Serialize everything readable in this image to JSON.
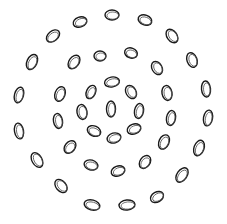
{
  "figure": {
    "stroke_color": "#1a1a1a",
    "background": "#ffffff",
    "rings": [
      {
        "name": "center",
        "loops": [
          {
            "cx": 111,
            "cy": 109,
            "rx": 4.5,
            "ry": 8,
            "rot": 0
          }
        ]
      },
      {
        "name": "ring-1",
        "loops": [
          {
            "cx": 91,
            "cy": 92,
            "rx": 4.5,
            "ry": 7,
            "rot": 25
          },
          {
            "cx": 112,
            "cy": 82,
            "rx": 7.5,
            "ry": 5,
            "rot": -10
          },
          {
            "cx": 131,
            "cy": 92,
            "rx": 5,
            "ry": 7,
            "rot": -30
          },
          {
            "cx": 139,
            "cy": 111,
            "rx": 4.5,
            "ry": 7.5,
            "rot": 10
          },
          {
            "cx": 134,
            "cy": 129,
            "rx": 7,
            "ry": 5,
            "rot": -20
          },
          {
            "cx": 114,
            "cy": 138,
            "rx": 7,
            "ry": 5,
            "rot": -15
          },
          {
            "cx": 94,
            "cy": 131,
            "rx": 7,
            "ry": 5,
            "rot": 25
          },
          {
            "cx": 82,
            "cy": 112,
            "rx": 5,
            "ry": 7.5,
            "rot": -10
          }
        ]
      },
      {
        "name": "ring-2",
        "loops": [
          {
            "cx": 74,
            "cy": 62,
            "rx": 5,
            "ry": 7.5,
            "rot": 35
          },
          {
            "cx": 100,
            "cy": 56,
            "rx": 6,
            "ry": 5,
            "rot": 0
          },
          {
            "cx": 131,
            "cy": 53,
            "rx": 6.5,
            "ry": 5,
            "rot": 20
          },
          {
            "cx": 157,
            "cy": 68,
            "rx": 5,
            "ry": 7,
            "rot": -30
          },
          {
            "cx": 167,
            "cy": 93,
            "rx": 5,
            "ry": 7.5,
            "rot": -10
          },
          {
            "cx": 171,
            "cy": 118,
            "rx": 4.5,
            "ry": 7.5,
            "rot": 10
          },
          {
            "cx": 164,
            "cy": 142,
            "rx": 5,
            "ry": 7.5,
            "rot": 25
          },
          {
            "cx": 145,
            "cy": 162,
            "rx": 5,
            "ry": 7,
            "rot": 35
          },
          {
            "cx": 118,
            "cy": 171,
            "rx": 7,
            "ry": 5,
            "rot": -20
          },
          {
            "cx": 91,
            "cy": 165,
            "rx": 7,
            "ry": 5,
            "rot": 15
          },
          {
            "cx": 70,
            "cy": 147,
            "rx": 5,
            "ry": 7,
            "rot": 40
          },
          {
            "cx": 58,
            "cy": 121,
            "rx": 4.5,
            "ry": 7.5,
            "rot": -10
          },
          {
            "cx": 60,
            "cy": 94,
            "rx": 5,
            "ry": 7.5,
            "rot": 20
          }
        ]
      },
      {
        "name": "ring-3",
        "loops": [
          {
            "cx": 80,
            "cy": 22,
            "rx": 7,
            "ry": 5,
            "rot": -20
          },
          {
            "cx": 112,
            "cy": 15,
            "rx": 7,
            "ry": 5,
            "rot": 0
          },
          {
            "cx": 145,
            "cy": 20,
            "rx": 7,
            "ry": 5,
            "rot": 20
          },
          {
            "cx": 172,
            "cy": 36,
            "rx": 5,
            "ry": 7.5,
            "rot": -35
          },
          {
            "cx": 192,
            "cy": 60,
            "rx": 5,
            "ry": 7.5,
            "rot": -20
          },
          {
            "cx": 206,
            "cy": 89,
            "rx": 4.5,
            "ry": 8,
            "rot": -5
          },
          {
            "cx": 208,
            "cy": 118,
            "rx": 4.5,
            "ry": 8,
            "rot": 10
          },
          {
            "cx": 199,
            "cy": 148,
            "rx": 5,
            "ry": 8,
            "rot": 20
          },
          {
            "cx": 182,
            "cy": 175,
            "rx": 5,
            "ry": 8,
            "rot": 35
          },
          {
            "cx": 157,
            "cy": 197,
            "rx": 7,
            "ry": 5,
            "rot": -30
          },
          {
            "cx": 127,
            "cy": 205,
            "rx": 8,
            "ry": 5,
            "rot": -5
          },
          {
            "cx": 92,
            "cy": 205,
            "rx": 8,
            "ry": 5,
            "rot": 15
          },
          {
            "cx": 61,
            "cy": 186,
            "rx": 5,
            "ry": 7.5,
            "rot": -40
          },
          {
            "cx": 37,
            "cy": 160,
            "rx": 5,
            "ry": 8,
            "rot": -30
          },
          {
            "cx": 19,
            "cy": 131,
            "rx": 4.5,
            "ry": 8,
            "rot": -10
          },
          {
            "cx": 19,
            "cy": 95,
            "rx": 4.5,
            "ry": 8,
            "rot": 15
          },
          {
            "cx": 32,
            "cy": 62,
            "rx": 5,
            "ry": 8,
            "rot": 25
          },
          {
            "cx": 53,
            "cy": 36,
            "rx": 5,
            "ry": 7.5,
            "rot": 50
          }
        ]
      }
    ]
  }
}
